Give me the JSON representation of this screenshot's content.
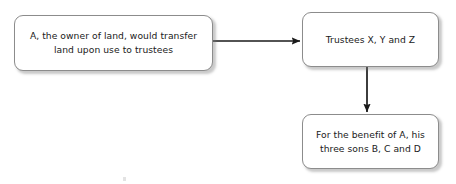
{
  "diagram": {
    "background_color": "#ffffff",
    "box_border_color": "#8c8c8c",
    "text_color": "#212121",
    "connector_color": "#1a1a1a",
    "nodes": [
      {
        "id": "transferor",
        "label": "A, the owner of land, would transfer\nland upon use to trustees"
      },
      {
        "id": "trustees",
        "label": "Trustees X, Y and Z"
      },
      {
        "id": "beneficiaries",
        "label": "For the benefit of A, his\nthree sons B, C and D"
      }
    ],
    "connectors": [
      {
        "id": "transferor-to-trustees",
        "from": "transferor",
        "to": "trustees",
        "direction": "right",
        "arrowhead": "solid-triangle"
      },
      {
        "id": "trustees-to-beneficiaries",
        "from": "trustees",
        "to": "beneficiaries",
        "direction": "down",
        "arrowhead": "solid-triangle"
      }
    ]
  }
}
